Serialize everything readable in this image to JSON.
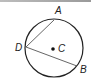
{
  "diagram": {
    "type": "circle-with-chords",
    "center": {
      "label": "C",
      "x": 54,
      "y": 48
    },
    "radius": 29,
    "points": [
      {
        "label": "A",
        "x": 54,
        "y": 20
      },
      {
        "label": "D",
        "x": 26,
        "y": 47
      },
      {
        "label": "B",
        "x": 77,
        "y": 66
      }
    ],
    "chords": [
      [
        "D",
        "A"
      ],
      [
        "D",
        "B"
      ]
    ],
    "colors": {
      "stroke": "#222222",
      "chord": "#555555",
      "topbar": "#a8a8a8"
    }
  },
  "labels": {
    "A": "A",
    "B": "B",
    "C": "C",
    "D": "D"
  }
}
